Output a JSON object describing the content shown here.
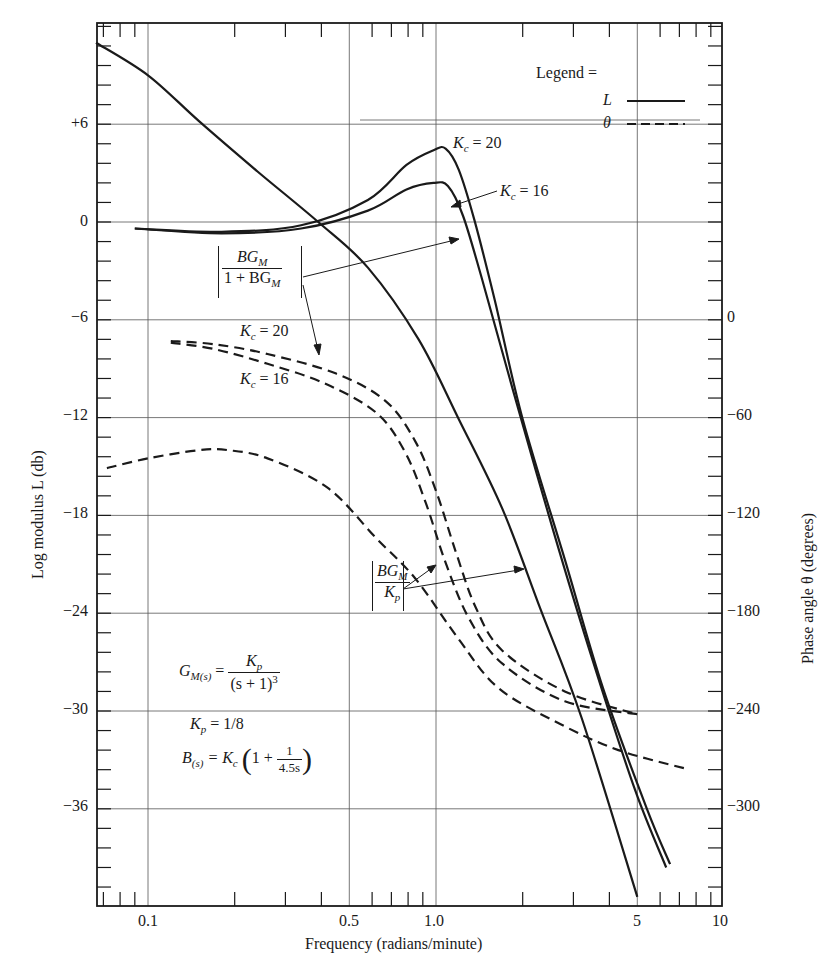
{
  "chart_data": {
    "type": "line",
    "title": "",
    "xlabel": "Frequency (radians/minute)",
    "ylabel": "Log modulus L (db)",
    "y2label": "Phase angle θ (degrees)",
    "xscale": "log",
    "xlim": [
      0.066,
      10
    ],
    "ylim": [
      -42,
      12
    ],
    "y2lim": [
      -360,
      180
    ],
    "grid": true,
    "x_ticks": [
      "0.1",
      "0.5",
      "1.0",
      "5",
      "10"
    ],
    "y_ticks": [
      "+6",
      "0",
      "-6",
      "-12",
      "-18",
      "-24",
      "-30",
      "-36"
    ],
    "y2_ticks": [
      "0",
      "-60",
      "-120",
      "-180",
      "-240",
      "-300"
    ],
    "legend": {
      "title": "Legend =",
      "entries": [
        {
          "label": "L",
          "style": "solid"
        },
        {
          "label": "θ",
          "style": "dashed"
        }
      ],
      "position": "upper right"
    },
    "series": [
      {
        "name": "L of BG_M/K_p (open loop)",
        "axis": "left",
        "style": "solid",
        "x": [
          0.066,
          0.1,
          0.15,
          0.24,
          0.39,
          0.58,
          0.87,
          1.2,
          1.7,
          2.3,
          3.2,
          5.0
        ],
        "y": [
          11.0,
          9.0,
          6.2,
          3.1,
          0.0,
          -2.8,
          -7.2,
          -12.1,
          -17.6,
          -23.7,
          -30.4,
          -41.4
        ]
      },
      {
        "name": "L of BG_M/(1+BG_M), Kc = 20",
        "axis": "left",
        "style": "solid",
        "x": [
          0.09,
          0.18,
          0.34,
          0.58,
          0.79,
          0.98,
          1.08,
          1.2,
          1.36,
          1.6,
          2.0,
          2.8,
          3.8,
          5.4,
          6.5
        ],
        "y": [
          -0.4,
          -0.6,
          -0.2,
          1.35,
          3.5,
          4.4,
          4.5,
          3.2,
          0.1,
          -4.8,
          -12.1,
          -20.7,
          -28.6,
          -36.0,
          -39.4
        ]
      },
      {
        "name": "L of BG_M/(1+BG_M), Kc = 16",
        "axis": "left",
        "style": "solid",
        "x": [
          0.09,
          0.18,
          0.34,
          0.58,
          0.79,
          0.98,
          1.1,
          1.24,
          1.45,
          1.85,
          2.55,
          3.5,
          4.9,
          6.3
        ],
        "y": [
          -0.4,
          -0.7,
          -0.4,
          0.7,
          2.0,
          2.4,
          2.2,
          0.4,
          -3.6,
          -10.3,
          -18.9,
          -26.9,
          -34.8,
          -39.6
        ]
      },
      {
        "name": "θ of BG_M/K_p (open loop)",
        "axis": "right",
        "style": "dashed",
        "x": [
          0.072,
          0.1,
          0.15,
          0.19,
          0.26,
          0.42,
          0.62,
          0.85,
          1.2,
          1.65,
          2.7,
          4.3,
          7.6
        ],
        "y": [
          -91,
          -85,
          -80,
          -80,
          -85,
          -103,
          -134,
          -159,
          -196,
          -226,
          -248,
          -264,
          -276
        ]
      },
      {
        "name": "θ of BG_M/(1+BG_M), Kc = 20",
        "axis": "right",
        "style": "dashed",
        "x": [
          0.12,
          0.17,
          0.26,
          0.45,
          0.67,
          0.85,
          1.0,
          1.17,
          1.37,
          1.7,
          2.8,
          5.0
        ],
        "y": [
          -13,
          -15,
          -21,
          -33,
          -50,
          -75,
          -105,
          -142,
          -176,
          -203,
          -228,
          -242
        ]
      },
      {
        "name": "θ of BG_M/(1+BG_M), Kc = 16",
        "axis": "right",
        "style": "dashed",
        "x": [
          0.12,
          0.17,
          0.26,
          0.41,
          0.62,
          0.78,
          0.92,
          1.08,
          1.3,
          1.7,
          2.8,
          5.0
        ],
        "y": [
          -14,
          -18,
          -27,
          -39,
          -57,
          -81,
          -112,
          -149,
          -183,
          -211,
          -234,
          -242
        ]
      }
    ],
    "annotations": [
      "Kc = 20",
      "Kc = 16",
      "[BG_M / (1 + BG_M)]",
      "Kc = 20",
      "Kc = 16",
      "[BG_M / K_p]",
      "G_M(s) = K_p / (s + 1)^3",
      "K_p = 1/8",
      "B(s) = K_c (1 + 1/(4.5s))"
    ]
  },
  "labels": {
    "xlabel": "Frequency (radians/minute)",
    "ylabel": "Log modulus L (db)",
    "y2label": "Phase angle θ (degrees)",
    "legend_title": "Legend =",
    "legend_L": "L",
    "legend_theta": "θ",
    "kc20_top": "= 20",
    "kc16_top": "= 16",
    "kc20_mid": "= 20",
    "kc16_mid": "= 16",
    "kc": "K",
    "kc_sub": "c",
    "closed_num": "BG",
    "closed_num_sub": "M",
    "closed_den": "1 + BG",
    "closed_den_sub": "M",
    "open_num": "BG",
    "open_num_sub": "M",
    "open_den": "K",
    "open_den_sub": "p",
    "eq1_lhs": "G",
    "eq1_lhs_sub": "M(s)",
    "eq1_eq": "=",
    "eq1_num": "K",
    "eq1_num_sub": "p",
    "eq1_den": "(s + 1)",
    "eq1_den_sup": "3",
    "eq2_lhs": "K",
    "eq2_lhs_sub": "p",
    "eq2_rhs": "= 1/8",
    "eq3_lhs": "B",
    "eq3_lhs_sub": "(s)",
    "eq3_mid": "= K",
    "eq3_mid_sub": "c",
    "eq3_paren_open": "(",
    "eq3_one": "1 +",
    "eq3_frac_num": "1",
    "eq3_frac_den": "4.5s",
    "eq3_paren_close": ")",
    "x_ticks": [
      "0.1",
      "0.5",
      "1.0",
      "5",
      "10"
    ],
    "y_ticks": [
      "+6",
      "0",
      "−6",
      "−12",
      "−18",
      "−24",
      "−30",
      "−36"
    ],
    "y2_ticks": [
      "0",
      "−60",
      "−120",
      "−180",
      "−240",
      "−300"
    ]
  }
}
